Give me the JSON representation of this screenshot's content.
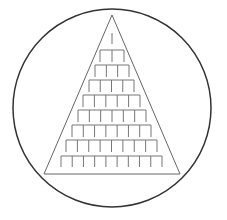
{
  "figure": {
    "width": 227,
    "height": 220,
    "background": "#ffffff",
    "circle": {
      "cx": 112,
      "cy": 108,
      "r": 99,
      "stroke": "#333333",
      "stroke_width": 1.5
    },
    "triangle": {
      "apex": [
        112,
        15
      ],
      "base_left": [
        44,
        174
      ],
      "base_right": [
        180,
        174
      ],
      "stroke": "#666666",
      "stroke_width": 1
    },
    "rows": [
      {
        "level": 1,
        "legs": 1,
        "bar_y": 33,
        "x_left": 112,
        "x_right": 112,
        "leg_bottom": 44
      },
      {
        "level": 2,
        "legs": 3,
        "bar_y": 50,
        "x_left": 100,
        "x_right": 124,
        "leg_bottom": 62
      },
      {
        "level": 3,
        "legs": 4,
        "bar_y": 65,
        "x_left": 95,
        "x_right": 129,
        "leg_bottom": 77
      },
      {
        "level": 4,
        "legs": 5,
        "bar_y": 80,
        "x_left": 89,
        "x_right": 134,
        "leg_bottom": 92
      },
      {
        "level": 5,
        "legs": 6,
        "bar_y": 95,
        "x_left": 83,
        "x_right": 140,
        "leg_bottom": 107
      },
      {
        "level": 6,
        "legs": 7,
        "bar_y": 110,
        "x_left": 78,
        "x_right": 146,
        "leg_bottom": 122
      },
      {
        "level": 7,
        "legs": 8,
        "bar_y": 125,
        "x_left": 72,
        "x_right": 151,
        "leg_bottom": 137
      },
      {
        "level": 8,
        "legs": 9,
        "bar_y": 140,
        "x_left": 66,
        "x_right": 157,
        "leg_bottom": 152
      },
      {
        "level": 9,
        "legs": 10,
        "bar_y": 156,
        "x_left": 61,
        "x_right": 162,
        "leg_bottom": 167
      }
    ],
    "row_stroke": "#777777",
    "row_stroke_width": 1
  }
}
